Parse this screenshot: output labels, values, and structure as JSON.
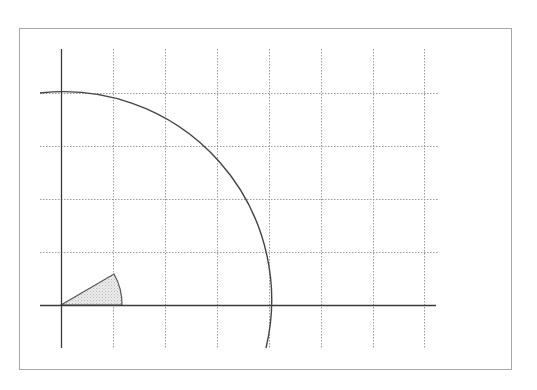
{
  "canvas": {
    "width": 537,
    "height": 390,
    "background": "#ffffff"
  },
  "frame": {
    "x": 19,
    "y": 28,
    "width": 492,
    "height": 341,
    "stroke": "#a8a8a8"
  },
  "colors": {
    "axis": "#3a3a3a",
    "grid": "#9a9a9a",
    "arc": "#444444",
    "sector_fill": "#e2e2e2",
    "sector_stroke": "#555555"
  },
  "origin": {
    "x": 61,
    "y": 305
  },
  "grid": {
    "vertical_x": [
      113,
      165,
      217,
      269,
      321,
      373,
      424
    ],
    "vertical_y_range": [
      49,
      348
    ],
    "horizontal_y": [
      93,
      146,
      199,
      252
    ],
    "horizontal_x_range": [
      40,
      438
    ],
    "dash": "1.5 1.5"
  },
  "axes": {
    "x_axis": {
      "x1": 40,
      "x2": 436,
      "y": 305
    },
    "y_axis": {
      "x": 61,
      "y1": 49,
      "y2": 348
    }
  },
  "circle_arc": {
    "center": [
      61,
      305
    ],
    "radius": 208,
    "start": [
      40,
      93
    ],
    "end": [
      266,
      348
    ],
    "description": "quarter-circle arc from top-left past y-axis to below x-axis"
  },
  "sector": {
    "center": [
      61,
      305
    ],
    "radius": 61,
    "angle_deg": 30,
    "tip": [
      114,
      274
    ],
    "arc_end": [
      122,
      305
    ],
    "fill_pattern": "stipple"
  }
}
